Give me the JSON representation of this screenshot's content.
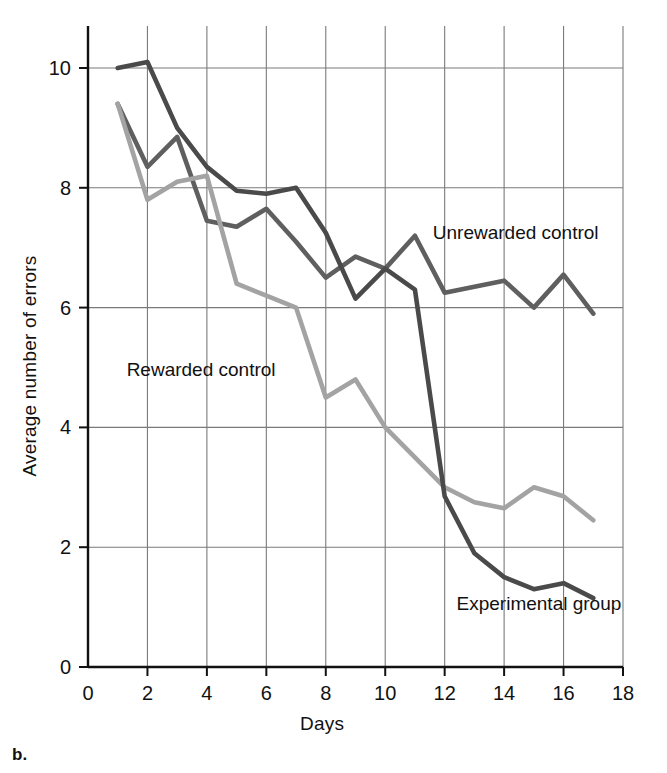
{
  "figure": {
    "panel_label": "b.",
    "x_axis_title": "Days",
    "y_axis_title": "Average number of errors"
  },
  "chart_data": {
    "type": "line",
    "title": "",
    "xlabel": "Days",
    "ylabel": "Average number of errors",
    "xlim": [
      0,
      18
    ],
    "ylim": [
      0,
      10.6
    ],
    "xticks": [
      0,
      2,
      4,
      6,
      8,
      10,
      12,
      14,
      16,
      18
    ],
    "xtick_labels": [
      "0",
      "2",
      "4",
      "6",
      "8",
      "10",
      "12",
      "14",
      "16",
      "18"
    ],
    "yticks": [
      0,
      2,
      4,
      6,
      8,
      10
    ],
    "ytick_labels": [
      "0",
      "2",
      "4",
      "6",
      "8",
      "10"
    ],
    "grid": true,
    "legend_position": "inline-annotations",
    "x": [
      1,
      2,
      3,
      4,
      5,
      6,
      7,
      8,
      9,
      10,
      11,
      12,
      13,
      14,
      15,
      16,
      17
    ],
    "series": [
      {
        "name": "Unrewarded control",
        "color": "#5f5f5f",
        "label_x": 11.6,
        "label_y": 7.25,
        "values": [
          9.4,
          8.35,
          8.85,
          7.45,
          7.35,
          7.65,
          7.1,
          6.5,
          6.85,
          6.65,
          7.2,
          6.25,
          6.35,
          6.45,
          6.0,
          6.55,
          5.9
        ]
      },
      {
        "name": "Rewarded control",
        "color": "#a3a3a3",
        "label_x": 1.3,
        "label_y": 4.95,
        "values": [
          9.4,
          7.8,
          8.1,
          8.2,
          6.4,
          6.2,
          6.0,
          4.5,
          4.8,
          4.0,
          3.5,
          3.0,
          2.75,
          2.65,
          3.0,
          2.85,
          2.45
        ]
      },
      {
        "name": "Experimental group",
        "color": "#4a4a4a",
        "label_x": 12.4,
        "label_y": 1.05,
        "values": [
          10.0,
          10.1,
          9.0,
          8.35,
          7.95,
          7.9,
          8.0,
          7.25,
          6.15,
          6.65,
          6.3,
          2.85,
          1.9,
          1.5,
          1.3,
          1.4,
          1.15
        ]
      }
    ]
  }
}
